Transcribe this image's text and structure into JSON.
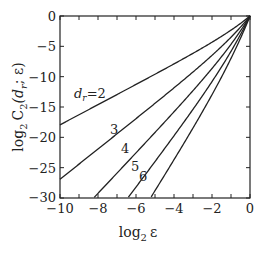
{
  "chart_data": {
    "type": "line",
    "title": "",
    "xlabel": "log2 ε",
    "ylabel": "log2 C2(dr; ε)",
    "xlim": [
      -10,
      0
    ],
    "ylim": [
      -30,
      0
    ],
    "x_ticks": [
      -10,
      -8,
      -6,
      -4,
      -2,
      0
    ],
    "y_ticks": [
      0,
      -5,
      -10,
      -15,
      -20,
      -25,
      -30
    ],
    "grid": false,
    "legend": "inline labels",
    "series": [
      {
        "name": "dr=2",
        "label": "d_r=2",
        "points": [
          [
            -10,
            -18
          ],
          [
            -8,
            -14.6
          ],
          [
            -6,
            -11.2
          ],
          [
            -4,
            -7.8
          ],
          [
            -2,
            -4.4
          ],
          [
            -1,
            -2.5
          ],
          [
            0,
            0
          ]
        ]
      },
      {
        "name": "dr=3",
        "label": "3",
        "points": [
          [
            -10,
            -27
          ],
          [
            -8,
            -21.9
          ],
          [
            -6,
            -16.9
          ],
          [
            -4,
            -11.8
          ],
          [
            -2,
            -6.6
          ],
          [
            -1,
            -3.7
          ],
          [
            0,
            0
          ]
        ]
      },
      {
        "name": "dr=4",
        "label": "4",
        "points": [
          [
            -8.2,
            -30
          ],
          [
            -6,
            -22.6
          ],
          [
            -4,
            -15.7
          ],
          [
            -2,
            -8.8
          ],
          [
            -1,
            -4.9
          ],
          [
            0,
            0
          ]
        ]
      },
      {
        "name": "dr=5",
        "label": "5",
        "points": [
          [
            -6.7,
            -30
          ],
          [
            -4,
            -19.7
          ],
          [
            -2,
            -11.0
          ],
          [
            -1,
            -6.2
          ],
          [
            0,
            0
          ]
        ]
      },
      {
        "name": "dr=6",
        "label": "6",
        "points": [
          [
            -5.8,
            -30
          ],
          [
            -4,
            -23.6
          ],
          [
            -2,
            -13.2
          ],
          [
            -1,
            -7.4
          ],
          [
            0,
            0
          ]
        ]
      }
    ]
  },
  "labels": {
    "xlabel": "log",
    "xlabel_sub": "2",
    "xlabel_var": "ε",
    "ylabel_main": "C",
    "ylabel_sub": "2",
    "ylabel_args": "(d",
    "ylabel_args_sub": "r",
    "ylabel_tail": "; ε)",
    "ylabel_log": "log",
    "ylabel_log_sub": "2",
    "curve_d2_prefix": "d",
    "curve_d2_sub": "r",
    "curve_d2_value": "=2",
    "curve_3": "3",
    "curve_4": "4",
    "curve_5": "5",
    "curve_6": "6",
    "xt": [
      "−10",
      "−8",
      "−6",
      "−4",
      "−2",
      "0"
    ],
    "yt": [
      "0",
      "−5",
      "−10",
      "−15",
      "−20",
      "−25",
      "−30"
    ]
  }
}
